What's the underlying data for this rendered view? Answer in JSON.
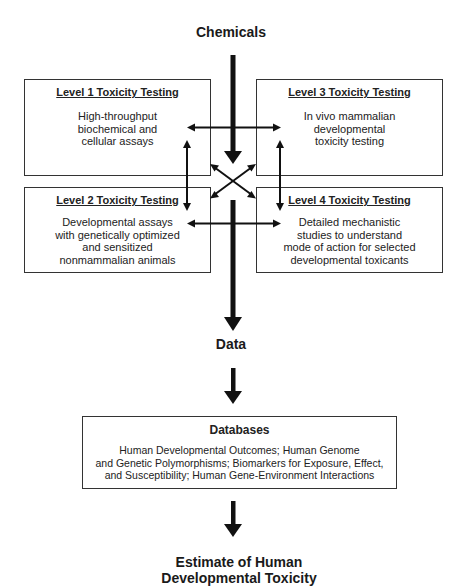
{
  "diagram": {
    "top_label": "Chemicals",
    "levels": [
      {
        "title": "Level 1 Toxicity Testing",
        "lines": [
          "High-throughput",
          "biochemical and",
          "cellular assays"
        ]
      },
      {
        "title": "Level 2 Toxicity Testing",
        "lines": [
          "Developmental assays",
          "with genetically optimized",
          "and sensitized",
          "nonmammalian animals"
        ]
      },
      {
        "title": "Level 3 Toxicity Testing",
        "lines": [
          "In vivo mammalian",
          "developmental",
          "toxicity testing"
        ]
      },
      {
        "title": "Level 4 Toxicity Testing",
        "lines": [
          "Detailed mechanistic",
          "studies to understand",
          "mode of action for selected",
          "developmental toxicants"
        ]
      }
    ],
    "data_label": "Data",
    "databases": {
      "title": "Databases",
      "lines": [
        "Human Developmental Outcomes; Human Genome",
        "and Genetic Polymorphisms; Biomarkers for Exposure, Effect,",
        "and Susceptibility; Human Gene-Environment Interactions"
      ]
    },
    "bottom_label": [
      "Estimate of Human",
      "Developmental Toxicity"
    ],
    "colors": {
      "ink": "#111111",
      "border": "#333333",
      "background": "#ffffff"
    }
  }
}
